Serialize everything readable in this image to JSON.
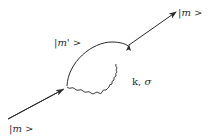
{
  "diagram": {
    "type": "feynman-self-energy",
    "labels": {
      "incoming_state": {
        "bar": "|",
        "symbol": "m",
        "ket": " >"
      },
      "intermediate_state": {
        "bar": "|",
        "symbol": "m'",
        "ket": " >"
      },
      "outgoing_state": {
        "bar": "|",
        "symbol": "m",
        "ket": " >"
      },
      "photon": {
        "momentum": "k",
        "separator": ", ",
        "polarization": "σ"
      }
    },
    "colors": {
      "line": "#2a2a2a",
      "background": "#ffffff"
    }
  }
}
